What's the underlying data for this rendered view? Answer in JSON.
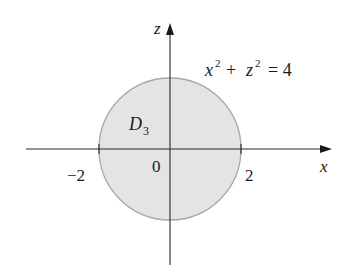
{
  "figure": {
    "type": "coordinate-plane region diagram",
    "axes": {
      "horizontal_label": "x",
      "vertical_label": "z",
      "origin_label": "0"
    },
    "ticks": {
      "left": "−2",
      "right": "2"
    },
    "region": {
      "label_main": "D",
      "label_sub": "3",
      "shape": "disk",
      "center": [
        0,
        0
      ],
      "radius": 2
    },
    "equation": {
      "var1": "x",
      "exp1": "2",
      "plus": "+",
      "var2": "z",
      "exp2": "2",
      "equals": "= 4"
    },
    "colors": {
      "region_fill": "#e4e4e4",
      "region_stroke": "#a8a8a8",
      "axis": "#2a2a2a",
      "text": "#1a1a1a"
    }
  }
}
